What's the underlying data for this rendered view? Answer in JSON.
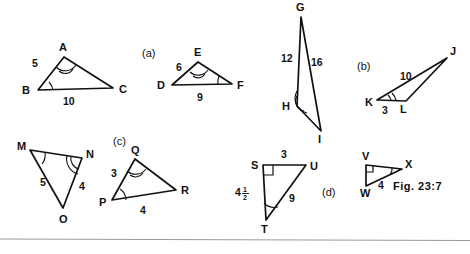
{
  "figure": {
    "caption": "Fig. 23:7",
    "background_color": "#ffffff",
    "ink_color": "#111111",
    "rule_color": "#9a9a9a"
  },
  "parts": {
    "a": "(a)",
    "b": "(b)",
    "c": "(c)",
    "d": "(d)"
  },
  "triangles": {
    "abc": {
      "vertices": {
        "A": "A",
        "B": "B",
        "C": "C"
      },
      "lengths": {
        "AB": "5",
        "BC": "10"
      },
      "marked_angles": [
        "A",
        "B"
      ]
    },
    "def": {
      "vertices": {
        "D": "D",
        "E": "E",
        "F": "F"
      },
      "lengths": {
        "DE": "6",
        "DF": "9"
      },
      "marked_angles": [
        "E",
        "F"
      ]
    },
    "ghi": {
      "vertices": {
        "G": "G",
        "H": "H",
        "I": "I"
      },
      "lengths": {
        "GH": "12",
        "GI": "16"
      },
      "marked_angles": [
        "H"
      ]
    },
    "jkl": {
      "vertices": {
        "J": "J",
        "K": "K",
        "L": "L"
      },
      "lengths": {
        "KJ": "10",
        "KL": "3"
      },
      "marked_angles": [
        "K"
      ]
    },
    "mno": {
      "vertices": {
        "M": "M",
        "N": "N",
        "O": "O"
      },
      "lengths": {
        "MO": "5",
        "NO": "4"
      },
      "marked_angles": [
        "M",
        "N"
      ]
    },
    "pqr": {
      "vertices": {
        "P": "P",
        "Q": "Q",
        "R": "R"
      },
      "lengths": {
        "PQ": "3",
        "PR": "4"
      },
      "marked_angles": [
        "P",
        "Q"
      ]
    },
    "stu": {
      "vertices": {
        "S": "S",
        "T": "T",
        "U": "U"
      },
      "lengths": {
        "SU": "3",
        "ST_whole": "4",
        "ST_num": "1",
        "ST_den": "2",
        "TU": "9"
      },
      "right_angle_at": "S",
      "marked_angles": [
        "T"
      ]
    },
    "vwx": {
      "vertices": {
        "V": "V",
        "W": "W",
        "X": "X"
      },
      "lengths": {
        "WX": "4"
      },
      "right_angle_at": "V",
      "marked_angles": [
        "X"
      ]
    }
  }
}
